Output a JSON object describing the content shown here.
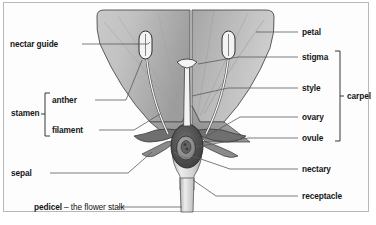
{
  "figure": {
    "background_color": "#fdfdfd",
    "border_color": "#b8b8b8",
    "label_color": "#161616",
    "leader_color": "#5a5a5a"
  },
  "labels_left": [
    {
      "id": "nectar-guide",
      "text": "nectar guide",
      "x": 10,
      "y": 40
    },
    {
      "id": "anther",
      "text": "anther",
      "x": 52,
      "y": 96
    },
    {
      "id": "stamen",
      "text": "stamen",
      "x": 11,
      "y": 109
    },
    {
      "id": "filament",
      "text": "filament",
      "x": 52,
      "y": 126
    },
    {
      "id": "sepal",
      "text": "sepal",
      "x": 11,
      "y": 169
    },
    {
      "id": "pedicel",
      "text": "pedicel",
      "x": 34,
      "y": 203,
      "suffix": " – the flower stalk"
    }
  ],
  "labels_right": [
    {
      "id": "petal",
      "text": "petal",
      "x": 302,
      "y": 28
    },
    {
      "id": "stigma",
      "text": "stigma",
      "x": 302,
      "y": 53
    },
    {
      "id": "style",
      "text": "style",
      "x": 302,
      "y": 84
    },
    {
      "id": "ovary",
      "text": "ovary",
      "x": 302,
      "y": 113
    },
    {
      "id": "ovule",
      "text": "ovule",
      "x": 302,
      "y": 134
    },
    {
      "id": "nectary",
      "text": "nectary",
      "x": 302,
      "y": 165
    },
    {
      "id": "receptacle",
      "text": "receptacle",
      "x": 302,
      "y": 192
    }
  ],
  "brackets": [
    {
      "id": "stamen-bracket",
      "label": "stamen",
      "groups": [
        "anther",
        "filament"
      ]
    },
    {
      "id": "carpel-bracket",
      "label": "carpel",
      "groups": [
        "stigma",
        "style",
        "ovary",
        "ovule"
      ],
      "x": 344,
      "y": 110
    }
  ],
  "bracket_labels": {
    "carpel": "carpel"
  },
  "parts": {
    "petal_left": "petal",
    "petal_right": "petal",
    "anther_left": "anther",
    "anther_right": "anther",
    "filament_left": "filament",
    "filament_right": "filament",
    "stigma": "stigma",
    "style": "style",
    "ovary": "ovary",
    "ovule": "ovule",
    "sepal_left": "sepal",
    "sepal_right": "sepal",
    "nectary": "nectary",
    "receptacle": "receptacle",
    "pedicel": "pedicel"
  },
  "colors": {
    "petal_light": "#d3d3d3",
    "petal_mid": "#b5b5b5",
    "petal_dark": "#9a9a9a",
    "sepal": "#7d7d7d",
    "ovary_dark": "#4a4a4a",
    "ovule_mid": "#8e8e8e",
    "style_light": "#efefef",
    "receptacle": "#c9c9c9",
    "outline": "#3a3a3a"
  }
}
